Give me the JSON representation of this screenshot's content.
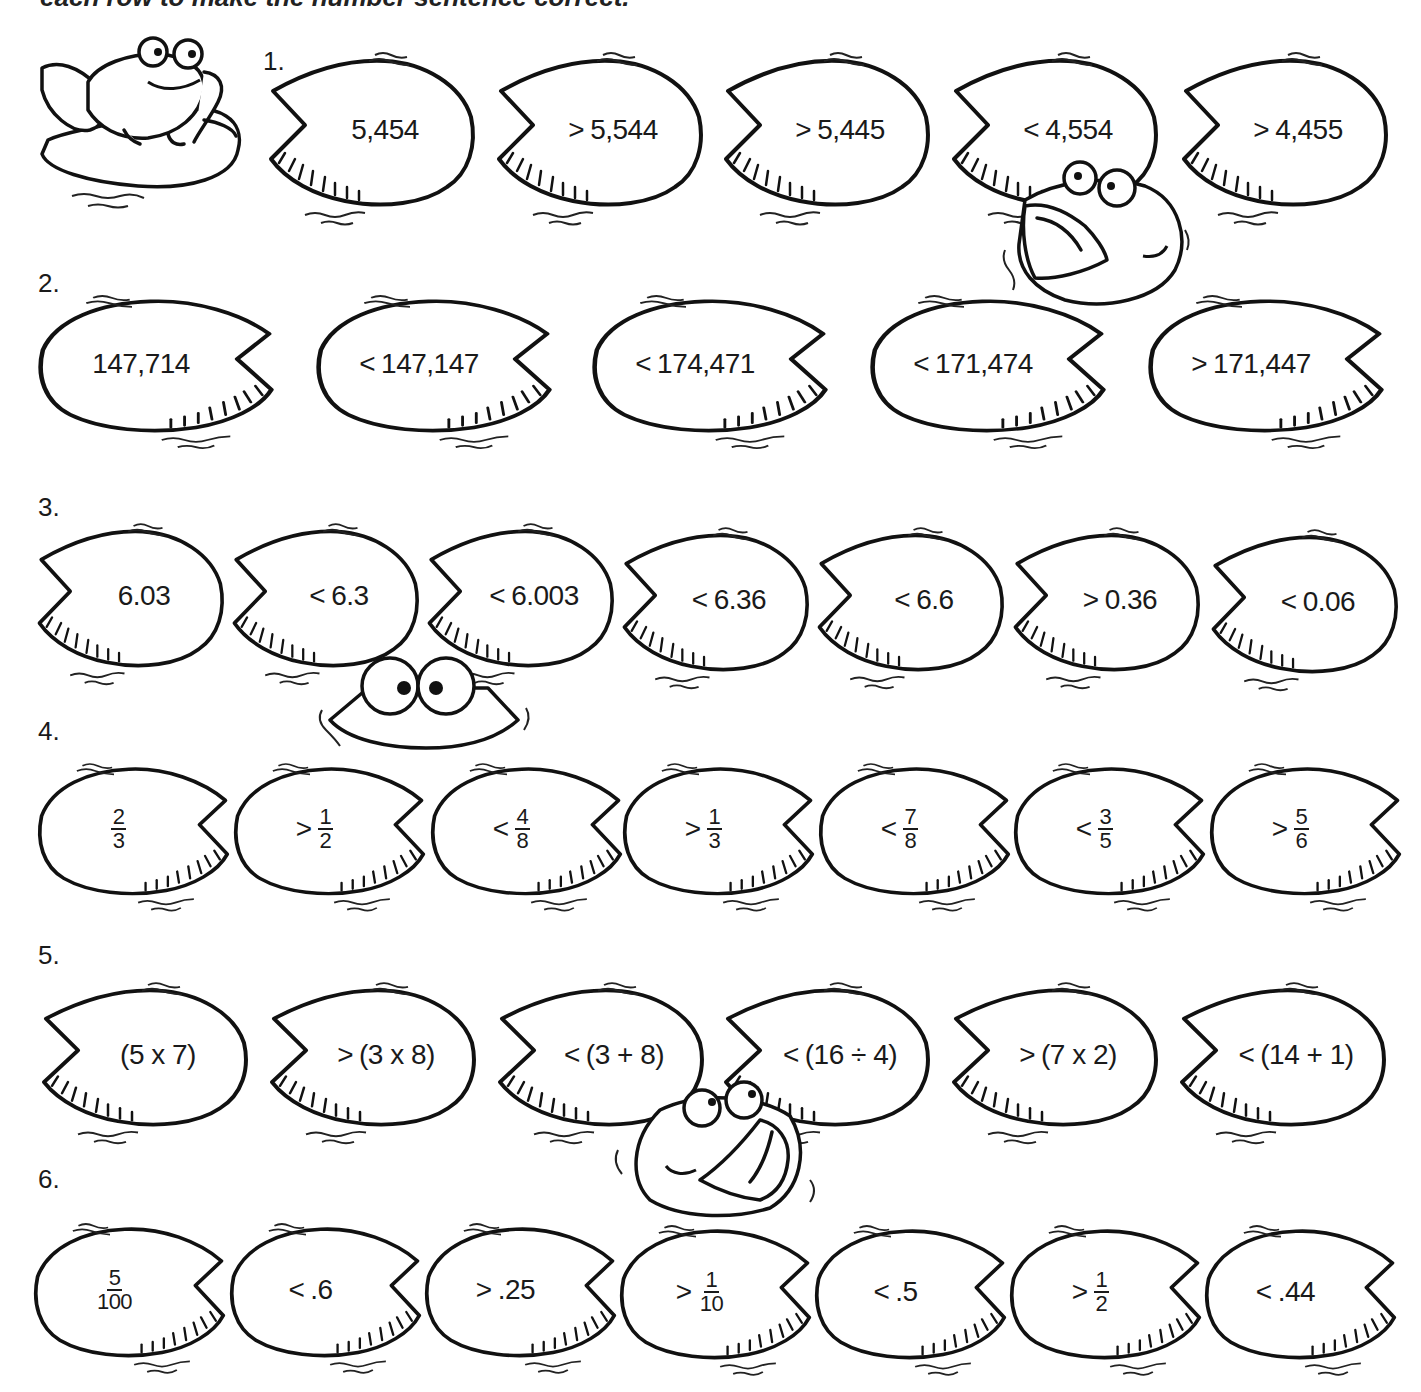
{
  "worksheet": {
    "instruction": "each row to make the number sentence correct.",
    "rows": [
      {
        "label": "1.",
        "pads": [
          {
            "op": "",
            "value": "5,454"
          },
          {
            "op": ">",
            "value": "5,544"
          },
          {
            "op": ">",
            "value": "5,445"
          },
          {
            "op": "<",
            "value": "4,554"
          },
          {
            "op": ">",
            "value": "4,455"
          }
        ]
      },
      {
        "label": "2.",
        "pads": [
          {
            "op": "",
            "value": "147,714"
          },
          {
            "op": "<",
            "value": "147,147"
          },
          {
            "op": "<",
            "value": "174,471"
          },
          {
            "op": "<",
            "value": "171,474"
          },
          {
            "op": ">",
            "value": "171,447"
          }
        ]
      },
      {
        "label": "3.",
        "pads": [
          {
            "op": "",
            "value": "6.03"
          },
          {
            "op": "<",
            "value": "6.3"
          },
          {
            "op": "<",
            "value": "6.003"
          },
          {
            "op": "<",
            "value": "6.36"
          },
          {
            "op": "<",
            "value": "6.6"
          },
          {
            "op": ">",
            "value": "0.36"
          },
          {
            "op": "<",
            "value": "0.06"
          }
        ]
      },
      {
        "label": "4.",
        "pads": [
          {
            "op": "",
            "num": "2",
            "den": "3"
          },
          {
            "op": ">",
            "num": "1",
            "den": "2"
          },
          {
            "op": "<",
            "num": "4",
            "den": "8"
          },
          {
            "op": ">",
            "num": "1",
            "den": "3"
          },
          {
            "op": "<",
            "num": "7",
            "den": "8"
          },
          {
            "op": "<",
            "num": "3",
            "den": "5"
          },
          {
            "op": ">",
            "num": "5",
            "den": "6"
          }
        ]
      },
      {
        "label": "5.",
        "pads": [
          {
            "op": "",
            "value": "(5 x 7)"
          },
          {
            "op": ">",
            "value": "(3 x 8)"
          },
          {
            "op": "<",
            "value": "(3 + 8)"
          },
          {
            "op": "<",
            "value": "(16 ÷ 4)"
          },
          {
            "op": ">",
            "value": "(7 x 2)"
          },
          {
            "op": "<",
            "value": "(14 + 1)"
          }
        ]
      },
      {
        "label": "6.",
        "pads": [
          {
            "op": "",
            "num": "5",
            "den": "100"
          },
          {
            "op": "<",
            "value": ".6"
          },
          {
            "op": ">",
            "value": ".25"
          },
          {
            "op": ">",
            "num": "1",
            "den": "10"
          },
          {
            "op": "<",
            "value": ".5"
          },
          {
            "op": ">",
            "num": "1",
            "den": "2"
          },
          {
            "op": "<",
            "value": ".44"
          }
        ]
      }
    ],
    "illustrations": [
      "frog-on-lily-pad",
      "frog-open-mouth",
      "frog-peeking-eyes",
      "frog-open-mouth"
    ]
  }
}
